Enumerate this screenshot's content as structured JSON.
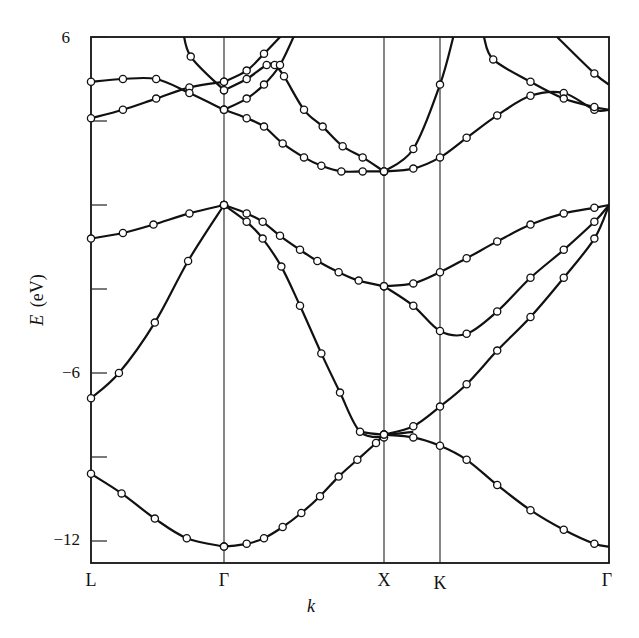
{
  "chart_data": {
    "type": "line",
    "title": "",
    "xlabel": "k",
    "ylabel": "E (eV)",
    "ylabel_italic_part": "E",
    "ylabel_unit": "(eV)",
    "ylim": [
      -13,
      6
    ],
    "yticks": [
      6,
      3,
      0,
      -3,
      -6,
      -9,
      -12
    ],
    "ytick_labels": [
      {
        "value": 6,
        "label": "6"
      },
      {
        "value": -6,
        "label": "−6"
      },
      {
        "value": -12,
        "label": "−12"
      }
    ],
    "grid": false,
    "legend": null,
    "symmetry_points": [
      {
        "label": "L",
        "k": 0.0
      },
      {
        "label": "Γ",
        "k": 1.0
      },
      {
        "label": "X",
        "k": 2.2
      },
      {
        "label": "K",
        "k": 2.62
      },
      {
        "label": "Γ",
        "k": 3.89
      }
    ],
    "bands": [
      {
        "name": "band-1",
        "segment": "L-Γ",
        "points": [
          [
            0,
            -9.6
          ],
          [
            0.23,
            -10.3
          ],
          [
            0.48,
            -11.2
          ],
          [
            0.72,
            -11.9
          ],
          [
            1.0,
            -12.2
          ]
        ]
      },
      {
        "name": "band-1",
        "segment": "Γ-X",
        "points": [
          [
            1.0,
            -12.2
          ],
          [
            0.0,
            0
          ]
        ]
      },
      {
        "name": "band-1",
        "segment": "Γ-X",
        "points": [
          [
            1.0,
            -12.2
          ],
          [
            1.17,
            -12.1
          ],
          [
            1.3,
            -11.9
          ],
          [
            1.44,
            -11.5
          ],
          [
            1.58,
            -11.0
          ],
          [
            1.72,
            -10.4
          ],
          [
            1.86,
            -9.7
          ],
          [
            2.0,
            -9.1
          ],
          [
            2.14,
            -8.5
          ],
          [
            2.2,
            -8.2
          ]
        ]
      },
      {
        "name": "band-2",
        "segment": "L-Γ",
        "points": [
          [
            0,
            -6.9
          ],
          [
            0.21,
            -6.0
          ],
          [
            0.48,
            -4.2
          ],
          [
            0.73,
            -2.0
          ],
          [
            1.0,
            0
          ]
        ]
      },
      {
        "name": "band-2",
        "segment": "Γ-X",
        "points": [
          [
            1.0,
            0
          ],
          [
            1.17,
            -0.6
          ],
          [
            1.29,
            -1.2
          ],
          [
            1.43,
            -2.2
          ],
          [
            1.57,
            -3.6
          ],
          [
            1.73,
            -5.3
          ],
          [
            1.87,
            -6.7
          ],
          [
            2.02,
            -8.1
          ],
          [
            2.2,
            -8.3
          ]
        ]
      },
      {
        "name": "band-3",
        "segment": "L-Γ",
        "points": [
          [
            0,
            -1.2
          ],
          [
            0.24,
            -1.0
          ],
          [
            0.47,
            -0.7
          ],
          [
            0.74,
            -0.3
          ],
          [
            1.0,
            0
          ]
        ]
      },
      {
        "name": "band-3",
        "segment": "Γ-X",
        "points": [
          [
            1.0,
            0
          ],
          [
            1.17,
            -0.3
          ],
          [
            1.29,
            -0.6
          ],
          [
            1.42,
            -1.1
          ],
          [
            1.57,
            -1.6
          ],
          [
            1.7,
            -2.0
          ],
          [
            1.86,
            -2.4
          ],
          [
            2.01,
            -2.7
          ],
          [
            2.2,
            -2.9
          ]
        ]
      },
      {
        "name": "band-5",
        "segment": "L-Γ",
        "points": [
          [
            0,
            3.1
          ],
          [
            0.24,
            3.4
          ],
          [
            0.49,
            3.8
          ],
          [
            0.74,
            4.2
          ],
          [
            1.0,
            4.4
          ]
        ]
      },
      {
        "name": "band-6",
        "segment": "L-Γ",
        "points": [
          [
            0,
            4.4
          ],
          [
            0.24,
            4.5
          ],
          [
            0.49,
            4.5
          ],
          [
            0.74,
            4.0
          ],
          [
            1.0,
            3.4
          ]
        ]
      },
      {
        "name": "band-6",
        "segment": "Γ-X",
        "points": [
          [
            1.0,
            3.4
          ],
          [
            1.17,
            3.1
          ],
          [
            1.3,
            2.8
          ],
          [
            1.44,
            2.2
          ],
          [
            1.6,
            1.7
          ],
          [
            1.73,
            1.4
          ],
          [
            1.88,
            1.2
          ],
          [
            2.04,
            1.2
          ],
          [
            2.2,
            1.2
          ]
        ]
      },
      {
        "name": "band-7",
        "segment": "Γ-X",
        "points": [
          [
            1.0,
            4.4
          ],
          [
            1.17,
            4.8
          ],
          [
            1.3,
            5.4
          ],
          [
            1.48,
            6.3
          ]
        ]
      },
      {
        "name": "band-8",
        "segment": "L-Γ",
        "points": [
          [
            0.69,
            6.3
          ],
          [
            0.75,
            5.3
          ],
          [
            1.0,
            4.1
          ]
        ]
      },
      {
        "name": "band-8",
        "segment": "Γ-X",
        "points": [
          [
            1.0,
            4.1
          ],
          [
            1.17,
            4.5
          ],
          [
            1.32,
            5.0
          ],
          [
            1.38,
            5.0
          ],
          [
            1.45,
            4.6
          ],
          [
            1.6,
            3.4
          ],
          [
            1.74,
            2.8
          ],
          [
            1.89,
            2.1
          ],
          [
            2.04,
            1.7
          ],
          [
            2.2,
            1.2
          ]
        ]
      },
      {
        "name": "band-9",
        "segment": "Γ-X",
        "points": [
          [
            1.0,
            3.4
          ],
          [
            1.17,
            3.8
          ],
          [
            1.3,
            4.3
          ],
          [
            1.42,
            5.0
          ],
          [
            1.55,
            6.3
          ]
        ]
      }
    ]
  },
  "page": {
    "y_axis_title_italic": "E",
    "y_axis_title_unit": "(eV)",
    "x_axis_title": "k",
    "ytick_6": "6",
    "ytick_m6": "−6",
    "ytick_m12": "−12",
    "k_labels": [
      "L",
      "Γ",
      "X",
      "K",
      "Γ"
    ]
  }
}
